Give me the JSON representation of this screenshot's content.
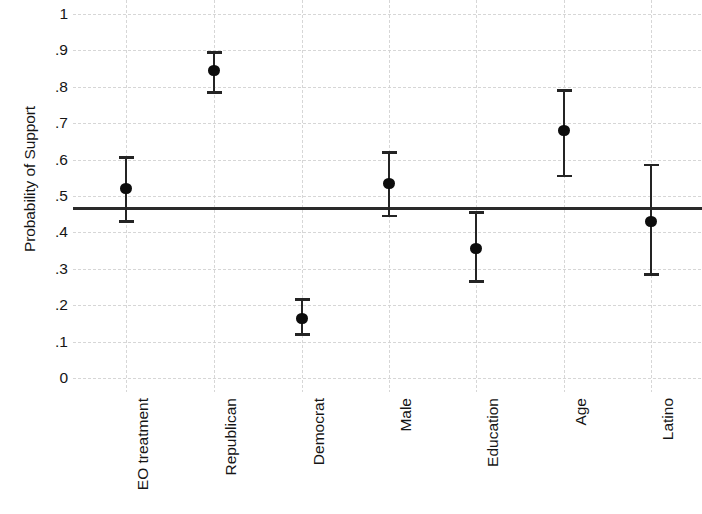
{
  "chart_data": {
    "type": "scatter",
    "title": "",
    "subtitle": "",
    "xlabel": "",
    "ylabel": "Probability of Support",
    "ylim": [
      0,
      1
    ],
    "ytick_labels": [
      "1",
      ".9",
      ".8",
      ".7",
      ".6",
      ".5",
      ".4",
      ".3",
      ".2",
      ".1",
      "0"
    ],
    "ytick_values": [
      1,
      0.9,
      0.8,
      0.7,
      0.6,
      0.5,
      0.4,
      0.3,
      0.2,
      0.1,
      0
    ],
    "grid": "both-dotted-light",
    "legend": "none",
    "reference_line": {
      "value": 0.465,
      "label": "",
      "style": "solid-black"
    },
    "categories": [
      "EO treatment",
      "Republican",
      "Democrat",
      "Male",
      "Education",
      "Age",
      "Latino"
    ],
    "point_estimates": [
      0.52,
      0.845,
      0.163,
      0.535,
      0.355,
      0.68,
      0.43
    ],
    "ci_lower": [
      0.43,
      0.785,
      0.12,
      0.445,
      0.265,
      0.555,
      0.285
    ],
    "ci_upper": [
      0.605,
      0.895,
      0.215,
      0.62,
      0.455,
      0.79,
      0.585
    ],
    "marker": "filled-circle",
    "error_bar_style": "capped-vertical"
  },
  "axis": {
    "y_title": "Probability of Support"
  }
}
